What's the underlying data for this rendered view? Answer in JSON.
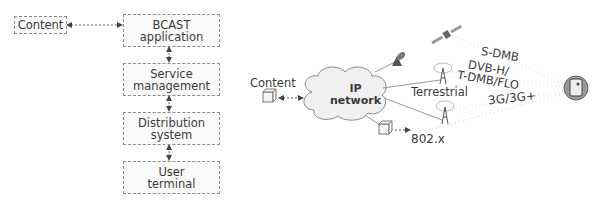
{
  "left_diagram": {
    "content_box": "Content",
    "stack": [
      {
        "line1": "BCAST",
        "line2": "application"
      },
      {
        "line1": "Service",
        "line2": "management"
      },
      {
        "line1": "Distribution",
        "line2": "system"
      },
      {
        "line1": "User",
        "line2": "terminal"
      }
    ]
  },
  "right_diagram": {
    "content_label": "Content",
    "cloud": {
      "line1": "IP",
      "line2": "network"
    },
    "terrestrial_label": "Terrestrial",
    "wifi_label": "802.x",
    "bearers": {
      "satellite": "S-DMB",
      "broadcast_line1": "DVB-H/",
      "broadcast_line2": "T-DMB/FLO",
      "cellular": "3G/3G+"
    }
  }
}
